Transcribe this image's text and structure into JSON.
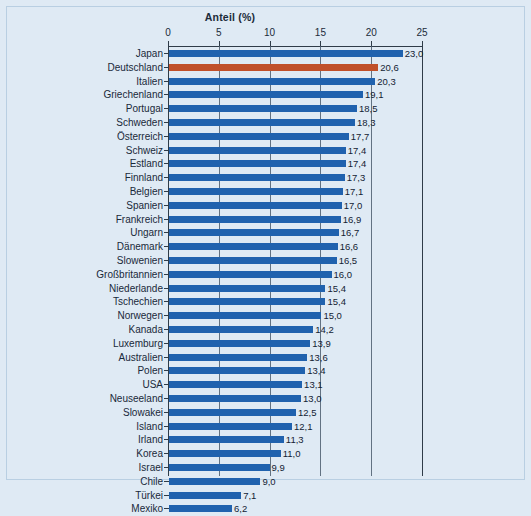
{
  "chart_data": {
    "type": "bar",
    "orientation": "horizontal",
    "title": "Anteil",
    "title_unit": "(%)",
    "xlabel": "",
    "ylabel": "",
    "xlim": [
      0,
      25
    ],
    "xticks": [
      0,
      5,
      10,
      15,
      20,
      25
    ],
    "xtick_labels": [
      "0",
      "5",
      "10",
      "15",
      "20",
      "25"
    ],
    "grid": true,
    "grid_axis": "x",
    "legend": null,
    "bar_color": "#2062ae",
    "highlight_color": "#c0502a",
    "highlight_category": "Deutschland",
    "decimal_separator": ",",
    "categories": [
      "Japan",
      "Deutschland",
      "Italien",
      "Griechenland",
      "Portugal",
      "Schweden",
      "Österreich",
      "Schweiz",
      "Estland",
      "Finnland",
      "Belgien",
      "Spanien",
      "Frankreich",
      "Ungarn",
      "Dänemark",
      "Slowenien",
      "Großbritannien",
      "Niederlande",
      "Tschechien",
      "Norwegen",
      "Kanada",
      "Luxemburg",
      "Australien",
      "Polen",
      "USA",
      "Neuseeland",
      "Slowakei",
      "Island",
      "Irland",
      "Korea",
      "Israel",
      "Chile",
      "Türkei",
      "Mexiko"
    ],
    "values": [
      23.0,
      20.6,
      20.3,
      19.1,
      18.5,
      18.3,
      17.7,
      17.4,
      17.4,
      17.3,
      17.1,
      17.0,
      16.9,
      16.7,
      16.6,
      16.5,
      16.0,
      15.4,
      15.4,
      15.0,
      14.2,
      13.9,
      13.6,
      13.4,
      13.1,
      13.0,
      12.5,
      12.1,
      11.3,
      11.0,
      9.9,
      9.0,
      7.1,
      6.2
    ],
    "value_labels": [
      "23,0",
      "20,6",
      "20,3",
      "19,1",
      "18,5",
      "18,3",
      "17,7",
      "17,4",
      "17,4",
      "17,3",
      "17,1",
      "17,0",
      "16,9",
      "16,7",
      "16,6",
      "16,5",
      "16,0",
      "15,4",
      "15,4",
      "15,0",
      "14,2",
      "13,9",
      "13,6",
      "13,4",
      "13,1",
      "13,0",
      "12,5",
      "12,1",
      "11,3",
      "11,0",
      "9,9",
      "9,0",
      "7,1",
      "6,2"
    ]
  }
}
